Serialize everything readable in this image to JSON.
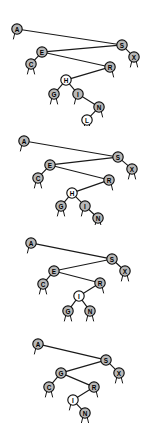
{
  "figure": {
    "background_color": "#ffffff",
    "node_fill_gray": "#b8b8b8",
    "node_fill_white": "#ffffff",
    "node_stroke": "#101010",
    "edge_color": "#1a1a1a",
    "panel_count": 4
  },
  "trees": [
    {
      "name": "tree-1",
      "top": 10,
      "height": 116,
      "nodes": [
        {
          "key": "A",
          "x": 17,
          "y": 19,
          "fill": "gray",
          "stubs": [
            "left"
          ]
        },
        {
          "key": "S",
          "x": 122,
          "y": 35,
          "fill": "gray",
          "stubs": []
        },
        {
          "key": "X",
          "x": 134,
          "y": 47,
          "fill": "gray",
          "stubs": [
            "left",
            "right"
          ]
        },
        {
          "key": "E",
          "x": 42,
          "y": 42,
          "fill": "gray",
          "stubs": []
        },
        {
          "key": "C",
          "x": 31,
          "y": 54,
          "fill": "gray",
          "stubs": [
            "left",
            "right"
          ]
        },
        {
          "key": "R",
          "x": 110,
          "y": 57,
          "fill": "gray",
          "stubs": [
            "right"
          ]
        },
        {
          "key": "H",
          "x": 66,
          "y": 70,
          "fill": "white",
          "stubs": []
        },
        {
          "key": "G",
          "x": 54,
          "y": 84,
          "fill": "gray",
          "stubs": [
            "left",
            "right"
          ]
        },
        {
          "key": "I",
          "x": 78,
          "y": 84,
          "fill": "gray",
          "stubs": [
            "left"
          ]
        },
        {
          "key": "N",
          "x": 99,
          "y": 97,
          "fill": "gray",
          "stubs": [
            "right"
          ]
        },
        {
          "key": "L",
          "x": 87,
          "y": 110,
          "fill": "white",
          "stubs": [
            "left",
            "right"
          ]
        }
      ],
      "edges": [
        [
          "A",
          "S"
        ],
        [
          "S",
          "X"
        ],
        [
          "S",
          "E"
        ],
        [
          "E",
          "C"
        ],
        [
          "E",
          "R"
        ],
        [
          "R",
          "H"
        ],
        [
          "H",
          "G"
        ],
        [
          "H",
          "I"
        ],
        [
          "I",
          "N"
        ],
        [
          "N",
          "L"
        ]
      ]
    },
    {
      "name": "tree-2",
      "top": 133,
      "height": 92,
      "nodes": [
        {
          "key": "A",
          "x": 24,
          "y": 8,
          "fill": "gray",
          "stubs": [
            "left"
          ]
        },
        {
          "key": "S",
          "x": 118,
          "y": 24,
          "fill": "gray",
          "stubs": []
        },
        {
          "key": "X",
          "x": 132,
          "y": 36,
          "fill": "gray",
          "stubs": [
            "left",
            "right"
          ]
        },
        {
          "key": "E",
          "x": 50,
          "y": 32,
          "fill": "gray",
          "stubs": []
        },
        {
          "key": "C",
          "x": 38,
          "y": 45,
          "fill": "gray",
          "stubs": [
            "left",
            "right"
          ]
        },
        {
          "key": "R",
          "x": 109,
          "y": 47,
          "fill": "gray",
          "stubs": [
            "right"
          ]
        },
        {
          "key": "H",
          "x": 72,
          "y": 60,
          "fill": "white",
          "stubs": []
        },
        {
          "key": "G",
          "x": 61,
          "y": 73,
          "fill": "gray",
          "stubs": [
            "left",
            "right"
          ]
        },
        {
          "key": "I",
          "x": 85,
          "y": 73,
          "fill": "gray",
          "stubs": [
            "left"
          ]
        },
        {
          "key": "N",
          "x": 98,
          "y": 85,
          "fill": "gray",
          "stubs": [
            "left",
            "right"
          ]
        }
      ],
      "edges": [
        [
          "A",
          "S"
        ],
        [
          "S",
          "X"
        ],
        [
          "S",
          "E"
        ],
        [
          "E",
          "C"
        ],
        [
          "E",
          "R"
        ],
        [
          "R",
          "H"
        ],
        [
          "H",
          "G"
        ],
        [
          "H",
          "I"
        ],
        [
          "I",
          "N"
        ]
      ]
    },
    {
      "name": "tree-3",
      "top": 234,
      "height": 90,
      "nodes": [
        {
          "key": "A",
          "x": 31,
          "y": 9,
          "fill": "gray",
          "stubs": [
            "left"
          ]
        },
        {
          "key": "S",
          "x": 112,
          "y": 25,
          "fill": "gray",
          "stubs": []
        },
        {
          "key": "X",
          "x": 125,
          "y": 37,
          "fill": "gray",
          "stubs": [
            "left",
            "right"
          ]
        },
        {
          "key": "E",
          "x": 54,
          "y": 37,
          "fill": "gray",
          "stubs": []
        },
        {
          "key": "C",
          "x": 43,
          "y": 50,
          "fill": "gray",
          "stubs": [
            "left",
            "right"
          ]
        },
        {
          "key": "R",
          "x": 100,
          "y": 49,
          "fill": "gray",
          "stubs": [
            "right"
          ]
        },
        {
          "key": "I",
          "x": 79,
          "y": 62,
          "fill": "white",
          "stubs": []
        },
        {
          "key": "G",
          "x": 68,
          "y": 77,
          "fill": "gray",
          "stubs": [
            "left",
            "right"
          ]
        },
        {
          "key": "N",
          "x": 90,
          "y": 77,
          "fill": "gray",
          "stubs": [
            "left",
            "right"
          ]
        }
      ],
      "edges": [
        [
          "A",
          "S"
        ],
        [
          "S",
          "X"
        ],
        [
          "S",
          "E"
        ],
        [
          "E",
          "C"
        ],
        [
          "E",
          "R"
        ],
        [
          "R",
          "I"
        ],
        [
          "I",
          "G"
        ],
        [
          "I",
          "N"
        ]
      ]
    },
    {
      "name": "tree-4",
      "top": 333,
      "height": 90,
      "nodes": [
        {
          "key": "A",
          "x": 38,
          "y": 11,
          "fill": "gray",
          "stubs": [
            "left"
          ]
        },
        {
          "key": "S",
          "x": 106,
          "y": 27,
          "fill": "gray",
          "stubs": []
        },
        {
          "key": "X",
          "x": 119,
          "y": 40,
          "fill": "gray",
          "stubs": [
            "left",
            "right"
          ]
        },
        {
          "key": "G",
          "x": 61,
          "y": 40,
          "fill": "gray",
          "stubs": []
        },
        {
          "key": "C",
          "x": 49,
          "y": 54,
          "fill": "gray",
          "stubs": [
            "left",
            "right"
          ]
        },
        {
          "key": "R",
          "x": 94,
          "y": 54,
          "fill": "gray",
          "stubs": [
            "right"
          ]
        },
        {
          "key": "I",
          "x": 73,
          "y": 67,
          "fill": "white",
          "stubs": [
            "left"
          ]
        },
        {
          "key": "N",
          "x": 85,
          "y": 80,
          "fill": "gray",
          "stubs": [
            "left",
            "right"
          ]
        }
      ],
      "edges": [
        [
          "A",
          "S"
        ],
        [
          "S",
          "X"
        ],
        [
          "S",
          "G"
        ],
        [
          "G",
          "C"
        ],
        [
          "G",
          "R"
        ],
        [
          "R",
          "I"
        ],
        [
          "I",
          "N"
        ]
      ]
    }
  ]
}
